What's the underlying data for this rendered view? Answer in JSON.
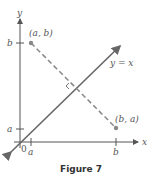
{
  "figure": {
    "caption": "Figure 7",
    "axis_x_label": "x",
    "axis_y_label": "y",
    "origin_label": "0",
    "x_ticks": [
      "a",
      "b"
    ],
    "y_ticks": [
      "b",
      "a"
    ],
    "point_ab_label": "(a, b)",
    "point_ba_label": "(b, a)",
    "line_label": "y = x",
    "colors": {
      "line": "#666666",
      "point": "#888888",
      "axis": "#555555"
    }
  }
}
